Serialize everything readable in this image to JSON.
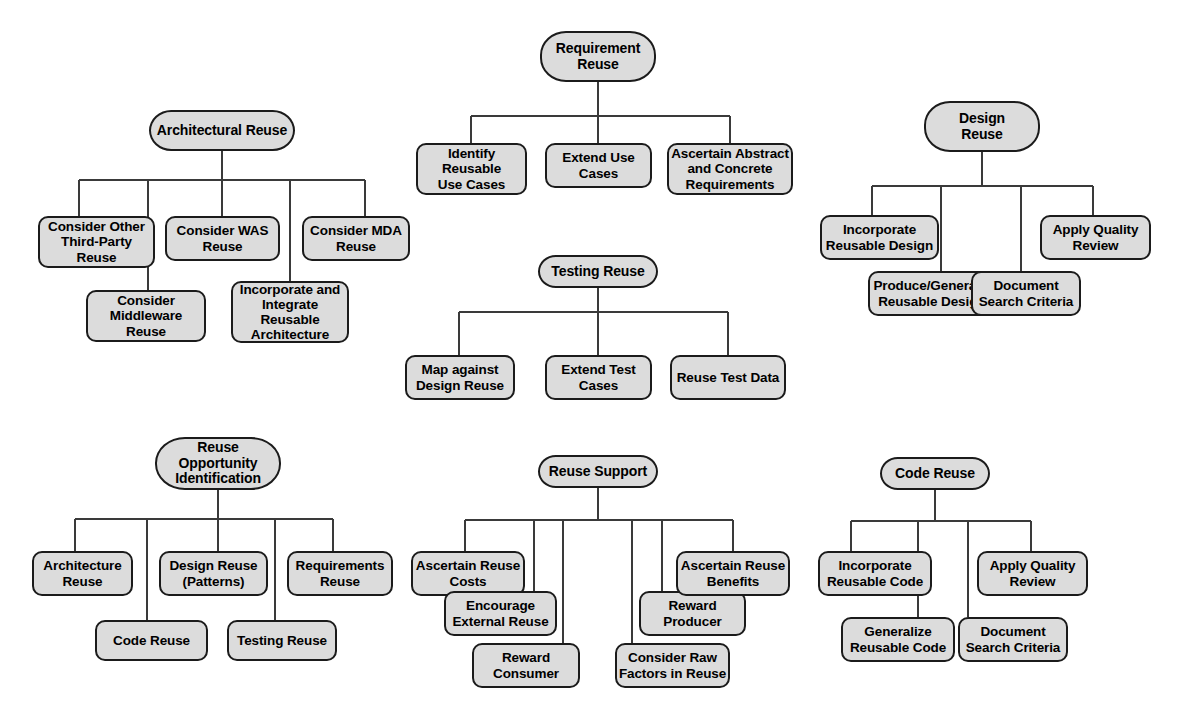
{
  "diagram": {
    "node_fill": "#dcdcdc",
    "node_stroke": "#1b1b1b",
    "line_color": "#3a3a3a",
    "background": "#ffffff"
  },
  "clusters": [
    {
      "id": "architectural-reuse",
      "root": "Architectural Reuse",
      "children": [
        "Consider Other\nThird-Party\nReuse",
        "Consider\nMiddleware\nReuse",
        "Consider WAS\nReuse",
        "Incorporate and\nIntegrate\nReusable\nArchitecture",
        "Consider MDA\nReuse"
      ]
    },
    {
      "id": "requirement-reuse",
      "root": "Requirement\nReuse",
      "children": [
        "Identify\nReusable\nUse Cases",
        "Extend Use\nCases",
        "Ascertain Abstract\nand Concrete\nRequirements"
      ]
    },
    {
      "id": "design-reuse",
      "root": "Design\nReuse",
      "children": [
        "Incorporate\nReusable Design",
        "Produce/Generalize\nReusable Designs",
        "Document\nSearch Criteria",
        "Apply Quality\nReview"
      ]
    },
    {
      "id": "testing-reuse",
      "root": "Testing Reuse",
      "children": [
        "Map against\nDesign Reuse",
        "Extend Test\nCases",
        "Reuse Test Data"
      ]
    },
    {
      "id": "reuse-opportunity-identification",
      "root": "Reuse\nOpportunity\nIdentification",
      "children": [
        "Architecture\nReuse",
        "Code Reuse",
        "Design Reuse\n(Patterns)",
        "Testing Reuse",
        "Requirements\nReuse"
      ]
    },
    {
      "id": "reuse-support",
      "root": "Reuse Support",
      "children": [
        "Ascertain Reuse\nCosts",
        "Encourage\nExternal Reuse",
        "Reward\nConsumer",
        "Consider Raw\nFactors in Reuse",
        "Reward\nProducer",
        "Ascertain Reuse\nBenefits"
      ]
    },
    {
      "id": "code-reuse",
      "root": "Code Reuse",
      "children": [
        "Incorporate\nReusable Code",
        "Generalize\nReusable Code",
        "Document\nSearch Criteria",
        "Apply Quality\nReview"
      ]
    }
  ]
}
